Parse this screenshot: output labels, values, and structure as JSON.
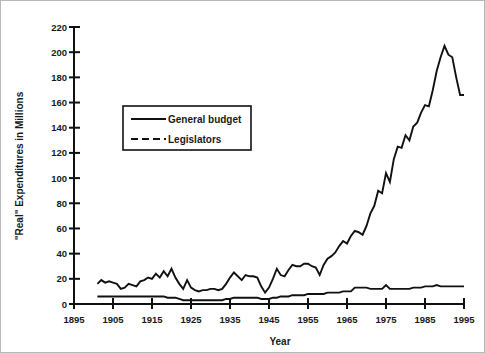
{
  "chart_data": {
    "type": "line",
    "title": "",
    "subtitle": "",
    "xlabel": "Year",
    "ylabel": "\"Real\" Expenditures in Millions",
    "xlim": [
      1895,
      1995
    ],
    "ylim": [
      0,
      220
    ],
    "xticks": [
      1895,
      1905,
      1915,
      1925,
      1935,
      1945,
      1955,
      1965,
      1975,
      1985,
      1995
    ],
    "yticks": [
      0,
      20,
      40,
      60,
      80,
      100,
      120,
      140,
      160,
      180,
      200,
      220
    ],
    "xtick_labels": [
      "1895",
      "1905",
      "1915",
      "1925",
      "1935",
      "1945",
      "1955",
      "1965",
      "1975",
      "1985",
      "1995"
    ],
    "ytick_labels": [
      "0",
      "20",
      "40",
      "60",
      "80",
      "100",
      "120",
      "140",
      "160",
      "180",
      "200",
      "220"
    ],
    "grid": false,
    "legend_position": "upper-left-inside",
    "legend_entries": [
      "General budget",
      "Legislators"
    ],
    "x": [
      1901,
      1902,
      1903,
      1904,
      1905,
      1906,
      1907,
      1908,
      1909,
      1910,
      1911,
      1912,
      1913,
      1914,
      1915,
      1916,
      1917,
      1918,
      1919,
      1920,
      1921,
      1922,
      1923,
      1924,
      1925,
      1926,
      1927,
      1928,
      1929,
      1930,
      1931,
      1932,
      1933,
      1934,
      1935,
      1936,
      1937,
      1938,
      1939,
      1940,
      1941,
      1942,
      1943,
      1944,
      1945,
      1946,
      1947,
      1948,
      1949,
      1950,
      1951,
      1952,
      1953,
      1954,
      1955,
      1956,
      1957,
      1958,
      1959,
      1960,
      1961,
      1962,
      1963,
      1964,
      1965,
      1966,
      1967,
      1968,
      1969,
      1970,
      1971,
      1972,
      1973,
      1974,
      1975,
      1976,
      1977,
      1978,
      1979,
      1980,
      1981,
      1982,
      1983,
      1984,
      1985,
      1986,
      1987,
      1988,
      1989,
      1990,
      1991,
      1992,
      1993,
      1994,
      1995
    ],
    "series": [
      {
        "name": "General budget",
        "style": "solid",
        "values": [
          16,
          19,
          17,
          18,
          17,
          16,
          12,
          13,
          16,
          15,
          14,
          18,
          19,
          21,
          20,
          24,
          21,
          26,
          22,
          28,
          21,
          16,
          12,
          19,
          13,
          11,
          10,
          11,
          11,
          12,
          12,
          11,
          12,
          16,
          21,
          25,
          22,
          19,
          23,
          22,
          22,
          21,
          14,
          9,
          13,
          20,
          28,
          23,
          22,
          27,
          31,
          30,
          30,
          32,
          32,
          30,
          29,
          23,
          31,
          36,
          38,
          41,
          46,
          50,
          48,
          54,
          58,
          57,
          55,
          62,
          72,
          78,
          90,
          88,
          104,
          97,
          115,
          125,
          124,
          134,
          130,
          141,
          144,
          152,
          158,
          157,
          170,
          185,
          196,
          205,
          198,
          196,
          180,
          166,
          166
        ]
      },
      {
        "name": "Legislators",
        "style": "dashed",
        "values": [
          6,
          6,
          6,
          6,
          6,
          6,
          6,
          6,
          6,
          6,
          6,
          6,
          6,
          6,
          6,
          6,
          6,
          6,
          5,
          5,
          5,
          4,
          3,
          3,
          3,
          3,
          3,
          3,
          3,
          3,
          3,
          3,
          3,
          4,
          4,
          5,
          5,
          5,
          5,
          5,
          5,
          5,
          4,
          4,
          4,
          5,
          5,
          6,
          6,
          6,
          7,
          7,
          7,
          7,
          8,
          8,
          8,
          8,
          8,
          9,
          9,
          9,
          9,
          10,
          10,
          10,
          13,
          13,
          13,
          13,
          12,
          12,
          12,
          12,
          15,
          12,
          12,
          12,
          12,
          12,
          12,
          13,
          13,
          13,
          14,
          14,
          14,
          15,
          14,
          14,
          14,
          14,
          14,
          14,
          14
        ]
      }
    ]
  },
  "axis": {
    "ylabel": "\"Real\" Expenditures in Millions",
    "xlabel": "Year"
  },
  "legend": {
    "items": [
      {
        "label": "General budget",
        "style": "solid"
      },
      {
        "label": "Legislators",
        "style": "dashed"
      }
    ]
  }
}
